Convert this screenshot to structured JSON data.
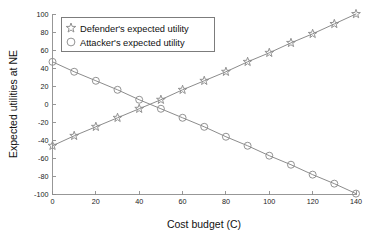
{
  "chart_data": {
    "type": "line",
    "title": "",
    "xlabel": "Cost budget (C)",
    "ylabel": "Expected utilities at NE",
    "xlim": [
      0,
      140
    ],
    "ylim": [
      -100,
      100
    ],
    "xticks": [
      0,
      20,
      40,
      60,
      80,
      100,
      120,
      140
    ],
    "yticks": [
      100,
      80,
      60,
      40,
      20,
      0,
      -20,
      -40,
      -60,
      -80,
      -100
    ],
    "xtick_labels": [
      "0",
      "20",
      "40",
      "60",
      "80",
      "100",
      "120",
      "140"
    ],
    "ytick_labels": [
      "100",
      "80",
      "60",
      "40",
      "20",
      "0",
      "-20",
      "-40",
      "-60",
      "-80",
      "-100"
    ],
    "grid": false,
    "legend_position": "upper left",
    "x": [
      0,
      10,
      20,
      30,
      40,
      50,
      60,
      70,
      80,
      90,
      100,
      110,
      120,
      130,
      140
    ],
    "series": [
      {
        "name": "Defender's expected utility",
        "marker": "star",
        "color": "#8c8c8c",
        "values": [
          -46,
          -35,
          -25,
          -15,
          -5,
          5,
          16,
          26,
          36,
          47,
          57,
          68,
          78,
          89,
          100
        ]
      },
      {
        "name": "Attacker's expected utility",
        "marker": "circle",
        "color": "#8c8c8c",
        "values": [
          47,
          36,
          26,
          16,
          5,
          -5,
          -15,
          -25,
          -36,
          -46,
          -57,
          -67,
          -78,
          -88,
          -99
        ]
      }
    ],
    "annotations": []
  },
  "legend": {
    "items": [
      {
        "label": "Defender's expected utility",
        "marker": "star-marker"
      },
      {
        "label": "Attacker's expected utility",
        "marker": "circle-marker"
      }
    ]
  },
  "axes": {
    "x_title": "Cost budget (C)",
    "y_title": "Expected utilities at NE"
  },
  "colors": {
    "series": "#8c8c8c",
    "axis": "#8c8c8c",
    "text": "#111111",
    "background": "#ffffff"
  }
}
